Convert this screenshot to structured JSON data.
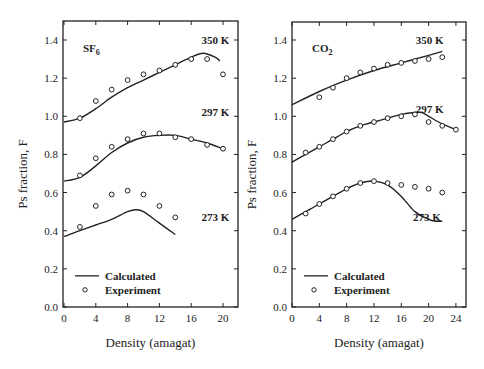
{
  "chart_data": [
    {
      "type": "line",
      "panel_label": "SF6",
      "panel_label_main": "SF",
      "panel_label_sub": "6",
      "xlabel": "Density (amagat)",
      "ylabel": "Ps fraction, F",
      "xlim": [
        0,
        22
      ],
      "ylim": [
        0,
        1.5
      ],
      "xticks": [
        0,
        4,
        8,
        12,
        16,
        20
      ],
      "yticks": [
        0.0,
        0.2,
        0.4,
        0.6,
        0.8,
        1.0,
        1.2,
        1.4
      ],
      "legend": [
        {
          "label": "Calculated",
          "marker": "line"
        },
        {
          "label": "Experiment",
          "marker": "open-circle"
        }
      ],
      "series": [
        {
          "name": "350 K",
          "calculated": {
            "x": [
              0,
              2,
              4,
              6,
              8,
              10,
              12,
              14,
              16,
              17.5,
              19,
              19.6
            ],
            "y": [
              0.97,
              0.99,
              1.04,
              1.1,
              1.15,
              1.19,
              1.23,
              1.27,
              1.31,
              1.33,
              1.31,
              1.29
            ]
          },
          "experiment": {
            "x": [
              2,
              4,
              6,
              8,
              10,
              12,
              14,
              16,
              18,
              20
            ],
            "y": [
              0.99,
              1.08,
              1.14,
              1.19,
              1.22,
              1.24,
              1.27,
              1.3,
              1.3,
              1.22
            ]
          }
        },
        {
          "name": "297 K",
          "calculated": {
            "x": [
              0,
              2,
              4,
              6,
              8,
              10,
              12,
              14,
              16,
              18,
              20
            ],
            "y": [
              0.66,
              0.68,
              0.74,
              0.81,
              0.86,
              0.89,
              0.9,
              0.9,
              0.88,
              0.86,
              0.83
            ]
          },
          "experiment": {
            "x": [
              2,
              4,
              6,
              8,
              10,
              12,
              14,
              16,
              18,
              20
            ],
            "y": [
              0.69,
              0.78,
              0.84,
              0.88,
              0.91,
              0.91,
              0.89,
              0.88,
              0.85,
              0.83
            ]
          }
        },
        {
          "name": "273 K",
          "calculated": {
            "x": [
              0,
              2,
              4,
              6,
              8,
              9,
              10,
              12,
              14
            ],
            "y": [
              0.37,
              0.4,
              0.43,
              0.46,
              0.5,
              0.51,
              0.5,
              0.44,
              0.38
            ]
          },
          "experiment": {
            "x": [
              2,
              4,
              6,
              8,
              10,
              12,
              14
            ],
            "y": [
              0.42,
              0.53,
              0.59,
              0.61,
              0.59,
              0.53,
              0.47
            ]
          }
        }
      ],
      "annotations": [
        {
          "text": "350 K",
          "x": 20.8,
          "y": 1.4
        },
        {
          "text": "297 K",
          "x": 20.8,
          "y": 1.02
        },
        {
          "text": "273 K",
          "x": 20.8,
          "y": 0.47
        }
      ]
    },
    {
      "type": "line",
      "panel_label": "CO2",
      "panel_label_main": "CO",
      "panel_label_sub": "2",
      "xlabel": "Density (amagat)",
      "ylabel": "Ps fraction, F",
      "xlim": [
        0,
        25.5
      ],
      "ylim": [
        0,
        1.5
      ],
      "xticks": [
        0,
        4,
        8,
        12,
        16,
        20,
        24
      ],
      "yticks": [
        0.0,
        0.2,
        0.4,
        0.6,
        0.8,
        1.0,
        1.2,
        1.4
      ],
      "legend": [
        {
          "label": "Calculated",
          "marker": "line"
        },
        {
          "label": "Experiment",
          "marker": "open-circle"
        }
      ],
      "series": [
        {
          "name": "350 K",
          "calculated": {
            "x": [
              0,
              4,
              8,
              12,
              16,
              20,
              22
            ],
            "y": [
              1.06,
              1.13,
              1.19,
              1.24,
              1.28,
              1.32,
              1.34
            ]
          },
          "experiment": {
            "x": [
              4,
              6,
              8,
              10,
              12,
              14,
              16,
              18,
              20,
              22
            ],
            "y": [
              1.1,
              1.15,
              1.2,
              1.23,
              1.25,
              1.27,
              1.28,
              1.29,
              1.3,
              1.31
            ]
          }
        },
        {
          "name": "297 K",
          "calculated": {
            "x": [
              0,
              2,
              4,
              6,
              8,
              10,
              12,
              14,
              16,
              18,
              19,
              20,
              22,
              24
            ],
            "y": [
              0.76,
              0.8,
              0.84,
              0.88,
              0.92,
              0.95,
              0.97,
              0.99,
              1.01,
              1.02,
              1.02,
              1.0,
              0.96,
              0.93
            ]
          },
          "experiment": {
            "x": [
              2,
              4,
              6,
              8,
              10,
              12,
              14,
              16,
              18,
              20,
              22,
              24
            ],
            "y": [
              0.81,
              0.84,
              0.88,
              0.92,
              0.95,
              0.97,
              0.99,
              1.0,
              1.01,
              0.97,
              0.95,
              0.93
            ]
          }
        },
        {
          "name": "273 K",
          "calculated": {
            "x": [
              0,
              2,
              4,
              6,
              8,
              10,
              12,
              14,
              16,
              18,
              20,
              21,
              22
            ],
            "y": [
              0.46,
              0.5,
              0.54,
              0.58,
              0.62,
              0.65,
              0.66,
              0.64,
              0.58,
              0.5,
              0.46,
              0.45,
              0.45
            ]
          },
          "experiment": {
            "x": [
              2,
              4,
              6,
              8,
              10,
              12,
              14,
              16,
              18,
              20,
              22
            ],
            "y": [
              0.49,
              0.54,
              0.58,
              0.62,
              0.65,
              0.66,
              0.65,
              0.64,
              0.63,
              0.62,
              0.6
            ]
          }
        }
      ],
      "annotations": [
        {
          "text": "350 K",
          "x": 22.2,
          "y": 1.4
        },
        {
          "text": "297 K",
          "x": 22.2,
          "y": 1.04
        },
        {
          "text": "273 K",
          "x": 21.8,
          "y": 0.47
        }
      ]
    }
  ],
  "panels_layout": [
    {
      "left": 63,
      "right": 238,
      "top": 21,
      "bottom": 307,
      "x0px": 64,
      "xscale": 7.95
    },
    {
      "left": 292,
      "right": 466,
      "top": 22,
      "bottom": 307,
      "x0px": 292,
      "xscale": 6.83
    }
  ]
}
